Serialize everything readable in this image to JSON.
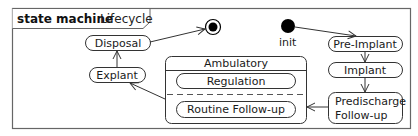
{
  "diagram": {
    "header": {
      "keyword": "state machine",
      "name": "Lifecycle"
    },
    "pseudostates": {
      "initial_label": "init",
      "final": "final-state"
    },
    "states": {
      "disposal": "Disposal",
      "explant": "Explant",
      "pre_implant": "Pre-Implant",
      "implant": "Implant",
      "predischarge_line1": "Predischarge",
      "predischarge_line2": "Follow-up"
    },
    "composite": {
      "title": "Ambulatory",
      "regions": [
        "Regulation",
        "Routine Follow-up"
      ]
    },
    "transitions": [
      {
        "from": "init",
        "to": "Pre-Implant"
      },
      {
        "from": "Pre-Implant",
        "to": "Implant"
      },
      {
        "from": "Implant",
        "to": "Predischarge Follow-up"
      },
      {
        "from": "Predischarge Follow-up",
        "to": "Ambulatory"
      },
      {
        "from": "Ambulatory",
        "to": "Explant"
      },
      {
        "from": "Explant",
        "to": "Disposal"
      },
      {
        "from": "Disposal",
        "to": "final"
      }
    ],
    "colors": {
      "stroke": "#333333",
      "frame": "#666666",
      "fill": "#ffffff",
      "pseudostate": "#000000"
    }
  }
}
